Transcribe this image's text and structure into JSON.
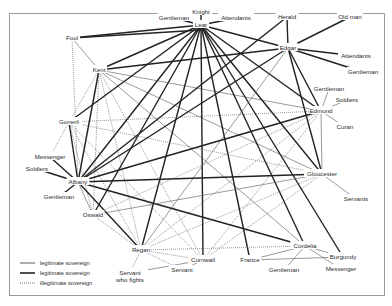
{
  "diagram": {
    "type": "character-network",
    "legend": [
      {
        "style": "thin",
        "label": "legitimate sovereign"
      },
      {
        "style": "thick",
        "label": "legitimate sovereign"
      },
      {
        "style": "dotted",
        "label": "illegitimate sovereign"
      }
    ],
    "nodes": [
      {
        "id": "knight",
        "label": "Knight",
        "x": 201,
        "y": 12
      },
      {
        "id": "lear",
        "label": "Lear",
        "x": 201,
        "y": 25
      },
      {
        "id": "gentleman_lear",
        "label": "Gentleman",
        "x": 174,
        "y": 18
      },
      {
        "id": "attendants_lear",
        "label": "Attendants",
        "x": 236,
        "y": 18
      },
      {
        "id": "fool",
        "label": "Fool",
        "x": 72,
        "y": 38
      },
      {
        "id": "kent",
        "label": "Kent",
        "x": 99,
        "y": 70
      },
      {
        "id": "herald",
        "label": "Herald",
        "x": 287,
        "y": 17
      },
      {
        "id": "old_man",
        "label": "Old man",
        "x": 350,
        "y": 17
      },
      {
        "id": "edgar",
        "label": "Edgar",
        "x": 288,
        "y": 48
      },
      {
        "id": "attendants_edgar",
        "label": "Attendants",
        "x": 356,
        "y": 56
      },
      {
        "id": "gentleman_edgar",
        "label": "Gentleman",
        "x": 363,
        "y": 72
      },
      {
        "id": "gentleman_edmund",
        "label": "Gentleman",
        "x": 329,
        "y": 89
      },
      {
        "id": "soldiers_edmund",
        "label": "Soldiers",
        "x": 347,
        "y": 100
      },
      {
        "id": "edmund",
        "label": "Edmund",
        "x": 321,
        "y": 111
      },
      {
        "id": "curan",
        "label": "Curan",
        "x": 345,
        "y": 127
      },
      {
        "id": "goneril",
        "label": "Goneril",
        "x": 69,
        "y": 122
      },
      {
        "id": "messenger_albany",
        "label": "Messenger",
        "x": 50,
        "y": 157
      },
      {
        "id": "soldiers_albany",
        "label": "Soldiers",
        "x": 37,
        "y": 169
      },
      {
        "id": "albany",
        "label": "Albany",
        "x": 78,
        "y": 182
      },
      {
        "id": "gentleman_albany",
        "label": "Gentleman",
        "x": 59,
        "y": 197
      },
      {
        "id": "oswald",
        "label": "Oswald",
        "x": 93,
        "y": 215
      },
      {
        "id": "gloucester",
        "label": "Gloucester",
        "x": 322,
        "y": 174
      },
      {
        "id": "servants",
        "label": "Servants",
        "x": 356,
        "y": 199
      },
      {
        "id": "regan",
        "label": "Regan",
        "x": 141,
        "y": 250
      },
      {
        "id": "cornwall",
        "label": "Cornwall",
        "x": 203,
        "y": 260
      },
      {
        "id": "servant_fights",
        "label": "Servant",
        "label2": "who fights",
        "x": 130,
        "y": 273
      },
      {
        "id": "servant",
        "label": "Servant",
        "x": 182,
        "y": 270
      },
      {
        "id": "cordelia",
        "label": "Cordelia",
        "x": 305,
        "y": 246
      },
      {
        "id": "burgundy",
        "label": "Burgundy",
        "x": 343,
        "y": 257
      },
      {
        "id": "france",
        "label": "France",
        "x": 250,
        "y": 260
      },
      {
        "id": "gentleman_cordelia",
        "label": "Gentleman",
        "x": 284,
        "y": 270
      },
      {
        "id": "messenger_cordelia",
        "label": "Messenger",
        "x": 341,
        "y": 269
      }
    ],
    "edges": [
      [
        "knight",
        "lear",
        "thick"
      ],
      [
        "gentleman_lear",
        "lear",
        "thick"
      ],
      [
        "attendants_lear",
        "lear",
        "thick"
      ],
      [
        "fool",
        "lear",
        "thick"
      ],
      [
        "fool",
        "lear2",
        "thick"
      ],
      [
        "fool",
        "kent",
        "thin"
      ],
      [
        "fool",
        "albany",
        "dotted"
      ],
      [
        "kent",
        "lear",
        "thick"
      ],
      [
        "kent",
        "edgar",
        "thick"
      ],
      [
        "kent",
        "goneril",
        "dotted"
      ],
      [
        "kent",
        "albany",
        "thick"
      ],
      [
        "kent",
        "regan",
        "dotted"
      ],
      [
        "kent",
        "cornwall",
        "dotted"
      ],
      [
        "kent",
        "oswald",
        "dotted"
      ],
      [
        "kent",
        "gloucester",
        "thin"
      ],
      [
        "kent",
        "edmund",
        "thin"
      ],
      [
        "kent",
        "cordelia",
        "thin"
      ],
      [
        "lear",
        "edgar",
        "thick"
      ],
      [
        "lear",
        "goneril",
        "thick"
      ],
      [
        "lear",
        "albany",
        "thick"
      ],
      [
        "lear",
        "regan",
        "thick"
      ],
      [
        "lear",
        "cornwall",
        "thick"
      ],
      [
        "lear",
        "gloucester",
        "thick"
      ],
      [
        "lear",
        "cordelia",
        "thick"
      ],
      [
        "lear",
        "oswald",
        "thick"
      ],
      [
        "lear",
        "edmund",
        "thick"
      ],
      [
        "lear",
        "france",
        "thick"
      ],
      [
        "lear",
        "burgundy",
        "thick"
      ],
      [
        "herald",
        "edgar",
        "thick"
      ],
      [
        "herald",
        "albany",
        "thick"
      ],
      [
        "old_man",
        "edgar",
        "thick"
      ],
      [
        "attendants_edgar",
        "edgar",
        "thick"
      ],
      [
        "gentleman_edgar",
        "edgar",
        "thick"
      ],
      [
        "edgar",
        "albany",
        "thick"
      ],
      [
        "edgar",
        "edmund",
        "thick"
      ],
      [
        "edgar",
        "gloucester",
        "thick"
      ],
      [
        "edgar",
        "regan",
        "thin"
      ],
      [
        "gentleman_edmund",
        "edmund",
        "thin"
      ],
      [
        "soldiers_edmund",
        "edmund",
        "thin"
      ],
      [
        "curan",
        "edmund",
        "thin"
      ],
      [
        "edmund",
        "goneril",
        "dotted"
      ],
      [
        "edmund",
        "albany",
        "thick"
      ],
      [
        "edmund",
        "regan",
        "dotted"
      ],
      [
        "edmund",
        "cornwall",
        "dotted"
      ],
      [
        "edmund",
        "gloucester",
        "thin"
      ],
      [
        "edmund",
        "oswald",
        "dotted"
      ],
      [
        "goneril",
        "albany",
        "thick"
      ],
      [
        "goneril",
        "regan",
        "dotted"
      ],
      [
        "goneril",
        "cornwall",
        "dotted"
      ],
      [
        "goneril",
        "gloucester",
        "dotted"
      ],
      [
        "goneril",
        "oswald",
        "dotted"
      ],
      [
        "goneril",
        "messenger_albany",
        "dotted"
      ],
      [
        "messenger_albany",
        "albany",
        "thick"
      ],
      [
        "soldiers_albany",
        "albany",
        "thick"
      ],
      [
        "gentleman_albany",
        "albany",
        "thick"
      ],
      [
        "albany",
        "gloucester",
        "thick"
      ],
      [
        "albany",
        "regan",
        "thick"
      ],
      [
        "albany",
        "cordelia",
        "thick"
      ],
      [
        "albany",
        "oswald",
        "thin"
      ],
      [
        "gloucester",
        "servants",
        "thin"
      ],
      [
        "gloucester",
        "regan",
        "dotted"
      ],
      [
        "gloucester",
        "cornwall",
        "dotted"
      ],
      [
        "gloucester",
        "oswald",
        "thin"
      ],
      [
        "regan",
        "cornwall",
        "dotted"
      ],
      [
        "regan",
        "oswald",
        "dotted"
      ],
      [
        "regan",
        "cordelia",
        "dotted"
      ],
      [
        "regan",
        "servant_fights",
        "dotted"
      ],
      [
        "regan",
        "servant",
        "dotted"
      ],
      [
        "cornwall",
        "servant_fights",
        "thin"
      ],
      [
        "cornwall",
        "servant",
        "thin"
      ],
      [
        "cordelia",
        "france",
        "thin"
      ],
      [
        "cordelia",
        "burgundy",
        "thin"
      ],
      [
        "cordelia",
        "gentleman_cordelia",
        "thin"
      ],
      [
        "cordelia",
        "messenger_cordelia",
        "thin"
      ],
      [
        "france",
        "burgundy",
        "thin"
      ]
    ]
  }
}
